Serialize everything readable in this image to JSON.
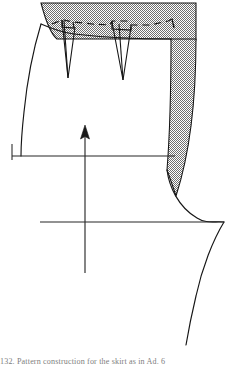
{
  "page": {
    "width": 236,
    "height": 371,
    "background": "#ffffff",
    "ink_color": "#1a1a1a",
    "shading_color": "#9a9a9a"
  },
  "caption": {
    "number": "132.",
    "text": "132.  Pattern construction for the skirt as in Ad. 6"
  },
  "figure": {
    "parts": [
      {
        "id": "waist-allowance-band",
        "label": "shaded waist allowance",
        "shaded": true
      },
      {
        "id": "side-seam-allowance-band",
        "label": "shaded side seam allowance",
        "shaded": true
      },
      {
        "id": "waist-seam-line",
        "label": "waist seam line",
        "shaded": false
      },
      {
        "id": "waist-cut-dashed-line",
        "label": "dashed waist cutting line",
        "shaded": false
      },
      {
        "id": "dart-left",
        "label": "left waist dart",
        "shaded": false
      },
      {
        "id": "dart-right",
        "label": "right waist dart",
        "shaded": false
      },
      {
        "id": "center-front-line",
        "label": "left centre front edge",
        "shaded": false
      },
      {
        "id": "hip-line",
        "label": "hip line",
        "shaded": false
      },
      {
        "id": "hem-line",
        "label": "hem line",
        "shaded": false
      },
      {
        "id": "grain-line-arrow",
        "label": "grain line arrow",
        "shaded": false
      },
      {
        "id": "side-seam-curve",
        "label": "side seam flare curve",
        "shaded": false
      }
    ],
    "geometry": {
      "shaded_band_top": 3,
      "shaded_band_left": 40,
      "shaded_band_right": 197,
      "waist_seam_y": 39,
      "hip_line_y": 156,
      "hem_line_y": 222,
      "grain_arrow_x": 85,
      "grain_arrow_top_y": 126,
      "grain_arrow_bottom_y": 273,
      "dart_left_x": 68,
      "dart_right_x": 123,
      "dart_point_left_y": 78,
      "dart_point_right_y": 80
    }
  }
}
